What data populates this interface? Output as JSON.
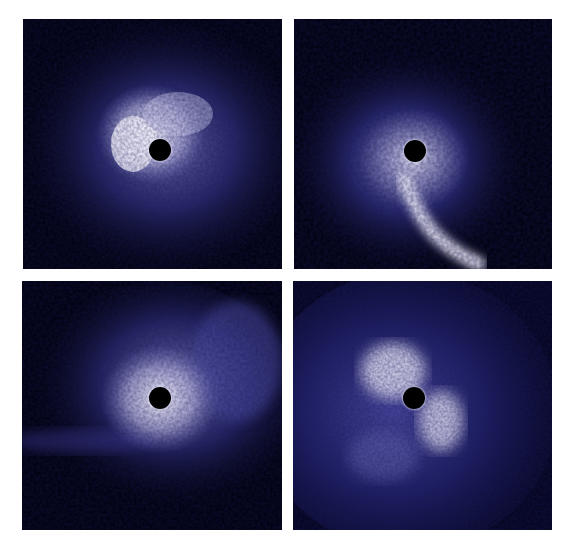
{
  "figure": {
    "layout": "2x2 grid of coronagraphic disk images",
    "background": "#ffffff",
    "panel_background": "#020213",
    "glow_color": "#e8e6f6",
    "halo_color": "#3a3a8c",
    "panels": [
      {
        "id": "top-left",
        "description": "Disk with bright arc left of occulted star, diffuse blue halo",
        "occulter": "black circular coronagraph mask"
      },
      {
        "id": "top-right",
        "description": "Clumpy halo around occulted star with a long bright tail curving down to lower right",
        "occulter": "black circular coronagraph mask"
      },
      {
        "id": "bottom-left",
        "description": "Bright ring around occulted star with extended nebulosity to upper right and a faint streak to the left",
        "occulter": "black circular coronagraph mask"
      },
      {
        "id": "bottom-right",
        "description": "Two-armed spiral-like structure around occulted star in noisy blue background",
        "occulter": "black circular coronagraph mask"
      }
    ]
  }
}
